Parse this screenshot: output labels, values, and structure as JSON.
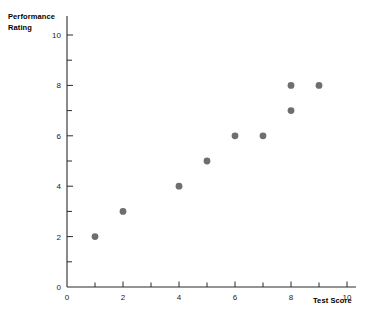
{
  "chart_data": {
    "type": "scatter",
    "title": "",
    "xlabel": "Test Score",
    "ylabel": "Performance\nRating",
    "ylabel_lines": [
      "Performance",
      "Rating"
    ],
    "xlim": [
      0,
      10
    ],
    "ylim": [
      0,
      10
    ],
    "grid": false,
    "legend": null,
    "x_ticks_major": [
      0,
      2,
      4,
      6,
      8,
      10
    ],
    "x_ticks_minor": [
      1,
      3,
      5,
      7,
      9
    ],
    "x_tick_labels": [
      "0",
      "2",
      "4",
      "6",
      "8",
      "10"
    ],
    "y_ticks_major": [
      0,
      2,
      4,
      6,
      8,
      10
    ],
    "y_ticks_minor": [
      1,
      3,
      5,
      7,
      9
    ],
    "y_tick_labels": [
      "0",
      "2",
      "4",
      "6",
      "8",
      "10"
    ],
    "marker": {
      "shape": "circle",
      "color": "#6e6e6e",
      "radius": 3.4
    },
    "points": [
      {
        "x": 1,
        "y": 2
      },
      {
        "x": 2,
        "y": 3
      },
      {
        "x": 4,
        "y": 4
      },
      {
        "x": 5,
        "y": 5
      },
      {
        "x": 6,
        "y": 6
      },
      {
        "x": 7,
        "y": 6
      },
      {
        "x": 8,
        "y": 7
      },
      {
        "x": 8,
        "y": 8
      },
      {
        "x": 9,
        "y": 8
      }
    ],
    "x": [
      1,
      2,
      4,
      5,
      6,
      7,
      8,
      8,
      9
    ],
    "values": [
      2,
      3,
      4,
      5,
      6,
      6,
      7,
      8,
      8
    ]
  },
  "colors": {
    "axis": "#2b2b2b",
    "marker": "#6e6e6e",
    "text": "#000000",
    "background": "#ffffff"
  }
}
